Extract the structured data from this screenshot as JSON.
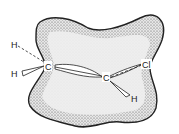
{
  "diagram": {
    "type": "molecular-orbital-illustration",
    "colors": {
      "outline": "#222222",
      "cloud_fill": "#ececec",
      "stipple": "#555555",
      "background": "#ffffff"
    },
    "atoms": {
      "h_upper_left": "H",
      "h_lower_left": "H",
      "c_left": "C",
      "c_right": "C",
      "cl": "Cl",
      "h_right": "H"
    }
  }
}
